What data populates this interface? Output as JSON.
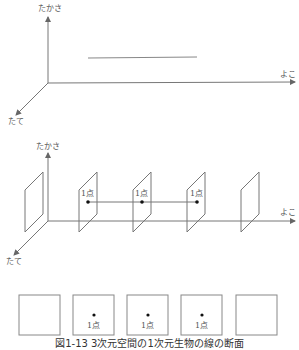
{
  "diagram1": {
    "axes": {
      "height_label": "たかさ",
      "horizontal_label": "よこ",
      "depth_label": "たて"
    }
  },
  "diagram2": {
    "axes": {
      "height_label": "たかさ",
      "horizontal_label": "よこ",
      "depth_label": "たて"
    },
    "planes": [
      {
        "point_label": ""
      },
      {
        "point_label": "1点"
      },
      {
        "point_label": "1点"
      },
      {
        "point_label": "1点"
      },
      {
        "point_label": ""
      }
    ]
  },
  "cross_sections": [
    {
      "point_label": ""
    },
    {
      "point_label": "1点"
    },
    {
      "point_label": "1点"
    },
    {
      "point_label": "1点"
    },
    {
      "point_label": ""
    }
  ],
  "caption": "図1-13 3次元空間の1次元生物の線の断面"
}
